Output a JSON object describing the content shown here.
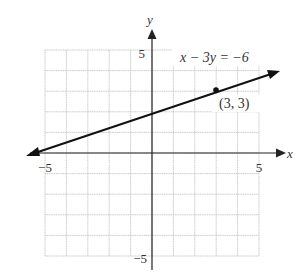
{
  "chart_data": {
    "type": "line",
    "title": "",
    "equation": "x − 3y = −6",
    "xlabel": "x",
    "ylabel": "y",
    "xlim": [
      -5,
      5
    ],
    "ylim": [
      -5,
      5
    ],
    "grid": true,
    "x_ticks_labeled": [
      "−5",
      "5"
    ],
    "y_ticks_labeled": [
      "5",
      "−5"
    ],
    "line": {
      "slope": 0.3333,
      "intercept": 2,
      "x": [
        -5.5,
        6.0
      ],
      "y": [
        0.1667,
        4.0
      ]
    },
    "points": [
      {
        "x": 3,
        "y": 3,
        "label": "(3, 3)"
      }
    ],
    "annotations": [
      "x − 3y = −6",
      "(3, 3)"
    ]
  },
  "labels": {
    "x_axis": "x",
    "y_axis": "y",
    "x_min": "−5",
    "x_max": "5",
    "y_max": "5",
    "y_min": "−5",
    "equation": "x − 3y = −6",
    "point": "(3, 3)"
  },
  "colors": {
    "grid": "#b8b8b8",
    "axis": "#222222",
    "line": "#111111",
    "text": "#333333"
  }
}
